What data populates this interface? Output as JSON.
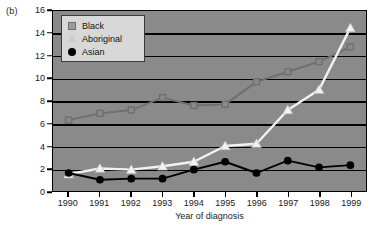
{
  "panel": {
    "label": "(b)"
  },
  "colors": {
    "plot_background": "#8a8a8a",
    "grid": "#000000",
    "black_series": "#6f6f6f",
    "aboriginal_series": "#f2f2f2",
    "asian_series": "#000000",
    "legend_background": "#d8d8d8",
    "text": "#1a1a1a"
  },
  "legend": {
    "position": "top-left-inside",
    "entries": [
      {
        "label": "Black",
        "marker": "square-marker-icon",
        "color": "#9b9b9b"
      },
      {
        "label": "Aboriginal",
        "marker": "triangle-marker-icon",
        "color": "#c9c9c9"
      },
      {
        "label": "Asian",
        "marker": "circle-marker-icon",
        "color": "#000000"
      }
    ]
  },
  "chart_data": {
    "type": "line",
    "title": "",
    "subtitle": "",
    "xlabel": "Year of diagnosis",
    "ylabel": "",
    "x": [
      1990,
      1991,
      1992,
      1993,
      1994,
      1995,
      1996,
      1997,
      1998,
      1999
    ],
    "categories": [
      "1990",
      "1991",
      "1992",
      "1993",
      "1994",
      "1995",
      "1996",
      "1997",
      "1998",
      "1999"
    ],
    "xlim": [
      1989.5,
      1999.5
    ],
    "ylim": [
      0,
      16
    ],
    "yticks": [
      0,
      2,
      4,
      6,
      8,
      10,
      12,
      14,
      16
    ],
    "ytick_labels": [
      "0",
      "2",
      "4",
      "6",
      "8",
      "10",
      "12",
      "14",
      "16"
    ],
    "grid": "horizontal",
    "legend_position": "upper left",
    "series": [
      {
        "name": "Black",
        "marker": "square",
        "color": "#6f6f6f",
        "values": [
          6.3,
          6.9,
          7.2,
          8.3,
          7.6,
          7.7,
          9.7,
          10.6,
          11.5,
          12.8
        ]
      },
      {
        "name": "Aboriginal",
        "marker": "triangle",
        "color": "#f2f2f2",
        "values": [
          1.5,
          2.0,
          1.9,
          2.2,
          2.6,
          4.0,
          4.2,
          7.2,
          9.0,
          14.5
        ]
      },
      {
        "name": "Asian",
        "marker": "circle",
        "color": "#000000",
        "values": [
          1.6,
          1.0,
          1.1,
          1.1,
          1.9,
          2.6,
          1.6,
          2.7,
          2.1,
          2.3
        ]
      }
    ]
  }
}
